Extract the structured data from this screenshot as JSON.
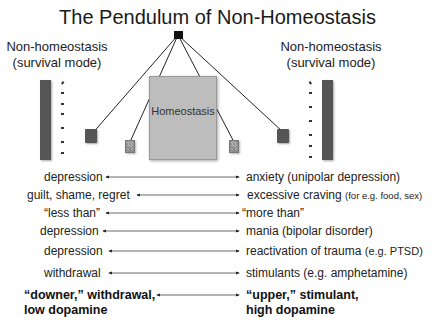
{
  "title": "The Pendulum of Non-Homeostasis",
  "left_label": {
    "line1": "Non-homeostasis",
    "line2": "(survival mode)"
  },
  "right_label": {
    "line1": "Non-homeostasis",
    "line2": "(survival mode)"
  },
  "center_box": {
    "label": "Homeostasis"
  },
  "colors": {
    "bar": "#555555",
    "homeostasis_box": "#bdbdbd",
    "pivot": "#111111",
    "background": "#ffffff"
  },
  "pendulum": {
    "pivot": {
      "x": 178,
      "y": 35
    },
    "bobs": [
      {
        "name": "left-outer",
        "style": "dark",
        "x": 91,
        "y": 135
      },
      {
        "name": "left-inner",
        "style": "hatched",
        "x": 129,
        "y": 146
      },
      {
        "name": "right-inner",
        "style": "hatched",
        "x": 233,
        "y": 146
      },
      {
        "name": "right-outer",
        "style": "dark",
        "x": 283,
        "y": 136
      }
    ]
  },
  "rows": [
    {
      "left": "depression",
      "right": "anxiety (unipolar depression)",
      "right_note": ""
    },
    {
      "left": "guilt, shame, regret",
      "right": "excessive craving",
      "right_note": "(for e.g. food, sex)"
    },
    {
      "left": "“less than”",
      "right": "“more than”",
      "right_note": ""
    },
    {
      "left": "depression",
      "right": "mania (bipolar disorder)",
      "right_note": ""
    },
    {
      "left": "depression",
      "right": "reactivation of trauma",
      "right_note": "(e.g. PTSD)"
    },
    {
      "left": "withdrawal",
      "right": "stimulants (e.g. amphetamine)",
      "right_note": ""
    }
  ],
  "summary_row": {
    "left_line1": "“downer,” withdrawal,",
    "left_line2": "low dopamine",
    "right_line1": "“upper,” stimulant,",
    "right_line2": "high dopamine"
  }
}
